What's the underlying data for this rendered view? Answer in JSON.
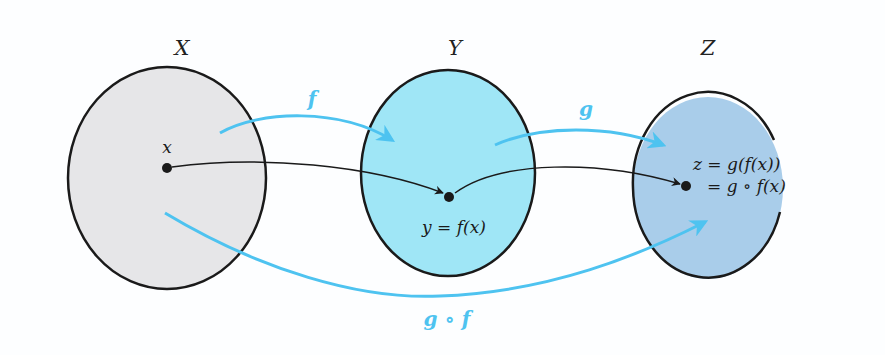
{
  "diagram": {
    "sets": [
      {
        "name": "X",
        "fill": "#e6e6e8"
      },
      {
        "name": "Y",
        "fill": "#9fe6f6"
      },
      {
        "name": "Z",
        "fill": "#a9cdea"
      }
    ],
    "points": {
      "x_label": "x",
      "y_label": "y = f(x)",
      "z_label_line1": "z = g(f(x))",
      "z_label_line2": "= g ∘ f(x)"
    },
    "maps": {
      "f": "f",
      "g": "g",
      "composite": "g ∘ f"
    },
    "colors": {
      "arrow_blue": "#4ec3f0",
      "outline": "#1a1a1a",
      "background": "#fdfeff"
    }
  }
}
